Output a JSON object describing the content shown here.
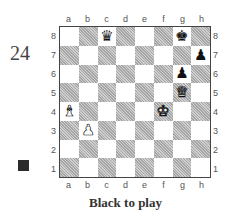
{
  "puzzle": {
    "number": "24",
    "caption": "Black to play",
    "side_to_move": "black",
    "side_marker_color": "#2b2b2b"
  },
  "board": {
    "files": [
      "a",
      "b",
      "c",
      "d",
      "e",
      "f",
      "g",
      "h"
    ],
    "ranks": [
      "8",
      "7",
      "6",
      "5",
      "4",
      "3",
      "2",
      "1"
    ],
    "pieces": [
      {
        "square": "c8",
        "color": "black",
        "type": "queen",
        "glyph": "♛"
      },
      {
        "square": "g8",
        "color": "black",
        "type": "king",
        "glyph": "♚"
      },
      {
        "square": "h7",
        "color": "black",
        "type": "pawn",
        "glyph": "♟"
      },
      {
        "square": "g6",
        "color": "black",
        "type": "pawn",
        "glyph": "♟"
      },
      {
        "square": "g5",
        "color": "white",
        "type": "queen",
        "glyph": "♛"
      },
      {
        "square": "a4",
        "color": "white",
        "type": "bishop",
        "glyph": "♝"
      },
      {
        "square": "f4",
        "color": "white",
        "type": "king",
        "glyph": "♚"
      },
      {
        "square": "b3",
        "color": "white",
        "type": "pawn",
        "glyph": "♟"
      }
    ],
    "light_square_color": "#ffffff",
    "dark_square_color": "#b9b9b9"
  }
}
